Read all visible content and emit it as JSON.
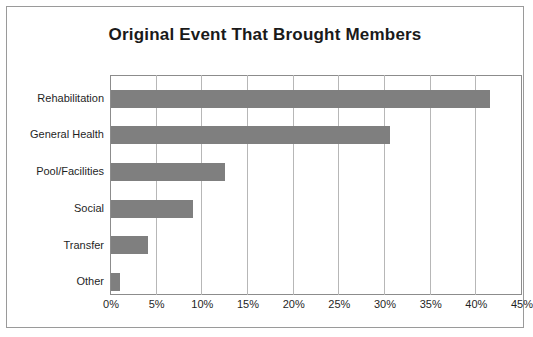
{
  "chart_data": {
    "type": "bar",
    "orientation": "horizontal",
    "title": "Original Event That Brought Members",
    "xlabel": "",
    "ylabel": "",
    "categories": [
      "Rehabilitation",
      "General Health",
      "Pool/Facilities",
      "Social",
      "Transfer",
      "Other"
    ],
    "values": [
      41.5,
      30.5,
      12.5,
      9.0,
      4.0,
      1.0
    ],
    "tick_labels": [
      "0%",
      "5%",
      "10%",
      "15%",
      "20%",
      "25%",
      "30%",
      "35%",
      "40%",
      "45%"
    ],
    "tick_values": [
      0,
      5,
      10,
      15,
      20,
      25,
      30,
      35,
      40,
      45
    ],
    "xlim": [
      0,
      45
    ],
    "grid": true,
    "legend": "none",
    "bar_color": "#7f7f7f",
    "plot_border_color": "#8c8c8c",
    "grid_color": "#b7b7b7",
    "frame_color": "#9a9a9a"
  }
}
